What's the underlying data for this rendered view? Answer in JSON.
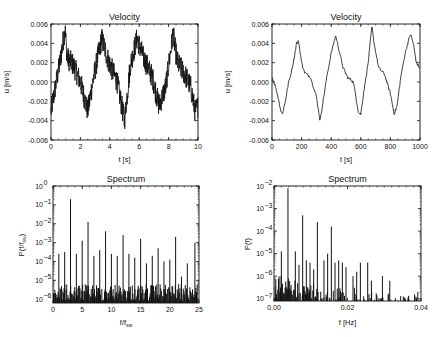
{
  "chart_data": [
    {
      "id": "velocity_left",
      "type": "line",
      "title": "Velocity",
      "xlabel": "t [s]",
      "ylabel": "u [m/s]",
      "xlim": [
        0,
        10
      ],
      "ylim": [
        -0.006,
        0.006
      ],
      "xticks": [
        0,
        2,
        4,
        6,
        8,
        10
      ],
      "yticks": [
        "-0.006",
        "-0.004",
        "-0.002",
        "0.000",
        "0.002",
        "0.004",
        "0.006"
      ],
      "noisy": true,
      "noise_amp": 0.0012,
      "x": [
        0,
        0.3,
        0.6,
        0.95,
        1.1,
        1.5,
        2.0,
        2.5,
        2.9,
        3.45,
        3.9,
        4.5,
        5.0,
        5.4,
        5.85,
        6.3,
        6.9,
        7.35,
        7.8,
        8.3,
        8.6,
        9.1,
        9.5,
        9.8,
        10
      ],
      "values": [
        -0.003,
        -0.0005,
        0.002,
        0.0055,
        0.0025,
        0.0018,
        0.0,
        -0.003,
        0.0005,
        0.0045,
        0.0022,
        0.0,
        -0.004,
        0.0018,
        0.0045,
        0.0025,
        0.0005,
        -0.0025,
        -0.0005,
        0.005,
        0.002,
        0.0008,
        -0.0005,
        -0.003,
        -0.0025
      ],
      "grid": false,
      "legend": null
    },
    {
      "id": "velocity_right",
      "type": "line",
      "title": "Velocity",
      "xlabel": "t [s]",
      "ylabel": "u [m/s]",
      "xlim": [
        0,
        1000
      ],
      "ylim": [
        -0.006,
        0.006
      ],
      "xticks": [
        0,
        200,
        400,
        600,
        800,
        1000
      ],
      "yticks": [
        "-0.006",
        "-0.004",
        "-0.002",
        "0.000",
        "0.002",
        "0.004",
        "0.006"
      ],
      "noisy": false,
      "noise_amp": 0.00015,
      "x": [
        0,
        20,
        40,
        60,
        70,
        90,
        110,
        130,
        150,
        165,
        180,
        200,
        220,
        260,
        300,
        325,
        345,
        370,
        400,
        430,
        450,
        480,
        510,
        550,
        585,
        600,
        620,
        650,
        675,
        690,
        720,
        760,
        800,
        825,
        845,
        870,
        900,
        935,
        955,
        975,
        1000
      ],
      "values": [
        0.0005,
        -0.0003,
        -0.0015,
        -0.003,
        -0.0033,
        -0.002,
        -0.0002,
        0.001,
        0.0025,
        0.004,
        0.0042,
        0.002,
        0.001,
        0.0005,
        -0.0015,
        -0.004,
        -0.002,
        0.0005,
        0.003,
        0.0048,
        0.0035,
        0.0015,
        0.0005,
        0.0,
        -0.0032,
        -0.0033,
        -0.001,
        0.002,
        0.0058,
        0.004,
        0.0015,
        0.0008,
        -0.0012,
        -0.0033,
        -0.0025,
        0.0005,
        0.003,
        0.005,
        0.004,
        0.002,
        0.0014
      ],
      "grid": false,
      "legend": null
    },
    {
      "id": "spectrum_left",
      "type": "bar",
      "title": "Spectrum",
      "xlabel": "f/f_sw",
      "ylabel": "P(f/f_sw)",
      "yscale": "log",
      "xlim": [
        0,
        25
      ],
      "ylim_exp": [
        -6.2,
        0
      ],
      "xticks": [
        0,
        5,
        10,
        15,
        20,
        25
      ],
      "yticks_exp": [
        0,
        -1,
        -2,
        -3,
        -4,
        -5,
        -6
      ],
      "noise_floor_exp": -5.2,
      "spikes_x": [
        1,
        2,
        3,
        4,
        5,
        6,
        7,
        8,
        9,
        10,
        11,
        12,
        13,
        14,
        15,
        16,
        17,
        18,
        19,
        20,
        21,
        22,
        23,
        24.3
      ],
      "spikes_exp": [
        -3.6,
        -3.5,
        -0.7,
        -3.6,
        -2.9,
        -1.9,
        -3.7,
        -3.4,
        -2.4,
        -3.6,
        -3.7,
        -2.6,
        -3.6,
        -3.8,
        -2.8,
        -4.1,
        -3.7,
        -3.3,
        -4.0,
        -3.9,
        -2.7,
        -4.8,
        -4.1,
        -3.0
      ],
      "grid": false,
      "legend": null
    },
    {
      "id": "spectrum_right",
      "type": "bar",
      "title": "Spectrum",
      "xlabel": "f [Hz]",
      "ylabel": "P(f)",
      "yscale": "log",
      "xlim": [
        0,
        0.04
      ],
      "ylim_exp": [
        -7.1,
        -2
      ],
      "xticks": [
        "0.00",
        "0.02",
        "0.04"
      ],
      "xtick_vals": [
        0,
        0.02,
        0.04
      ],
      "yticks_exp": [
        -2,
        -3,
        -4,
        -5,
        -6,
        -7
      ],
      "noise_floor_exp": -6.6,
      "spikes_x": [
        0.002,
        0.0038,
        0.0058,
        0.0068,
        0.0078,
        0.0088,
        0.0098,
        0.0108,
        0.0118,
        0.0136,
        0.0146,
        0.0156,
        0.0166,
        0.0176,
        0.0186,
        0.0196,
        0.0215,
        0.0225,
        0.0235,
        0.0255,
        0.0265,
        0.0295,
        0.0315
      ],
      "spikes_exp": [
        -4.9,
        -2.1,
        -4.9,
        -5.5,
        -3.3,
        -5.3,
        -5.4,
        -5.7,
        -3.6,
        -5.3,
        -5.0,
        -3.8,
        -5.4,
        -5.3,
        -5.4,
        -5.6,
        -6.0,
        -5.8,
        -5.4,
        -5.4,
        -6.2,
        -6.0,
        -6.2
      ],
      "grid": false,
      "legend": null
    }
  ],
  "panels": {
    "tl": {
      "title": "Velocity",
      "xlabel": "t [s]",
      "ylabel": "u [m/s]"
    },
    "tr": {
      "title": "Velocity",
      "xlabel": "t [s]",
      "ylabel": "u [m/s]"
    },
    "bl": {
      "title": "Spectrum",
      "xlabel": "f/f",
      "xlabel_sub": "sw",
      "ylabel": "P(f/f",
      "ylabel_sub": "sw",
      "ylabel_end": ")"
    },
    "br": {
      "title": "Spectrum",
      "xlabel": "f [Hz]",
      "ylabel": "P(f)"
    }
  },
  "colors": {
    "ink": "#111111",
    "background": "#ffffff"
  }
}
